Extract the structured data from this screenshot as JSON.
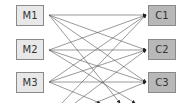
{
  "diagram": {
    "type": "bipartite-network",
    "sources": [
      {
        "id": "M1",
        "label": "M1"
      },
      {
        "id": "M2",
        "label": "M2"
      },
      {
        "id": "M3",
        "label": "M3"
      }
    ],
    "targets": [
      {
        "id": "C1",
        "label": "C1"
      },
      {
        "id": "C2",
        "label": "C2"
      },
      {
        "id": "C3",
        "label": "C3"
      }
    ],
    "edges": "all sources connect to all targets; additional edges continue beyond the bottom edge",
    "colors": {
      "source_fill": "#e8e8e8",
      "target_fill": "#b8b8b8",
      "border": "#8a8a8a",
      "edge": "#555555"
    }
  }
}
